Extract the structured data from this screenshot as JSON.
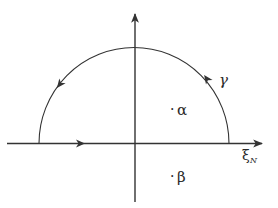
{
  "diagram": {
    "type": "contour-integration",
    "colors": {
      "stroke": "#333333",
      "text": "#2a2a2a",
      "background": "#ffffff"
    },
    "axes": {
      "horizontal": {
        "label": "ξ",
        "label_subscript": "N"
      },
      "vertical": {
        "label": ""
      }
    },
    "contour": {
      "label": "γ",
      "orientation": "counter-clockwise",
      "shape": "upper semicircle plus real-axis segment"
    },
    "points": [
      {
        "name": "alpha",
        "label": "α",
        "position": "upper half-plane (inside contour)"
      },
      {
        "name": "beta",
        "label": "β",
        "position": "lower half-plane (outside contour)"
      }
    ],
    "dot": "·"
  }
}
